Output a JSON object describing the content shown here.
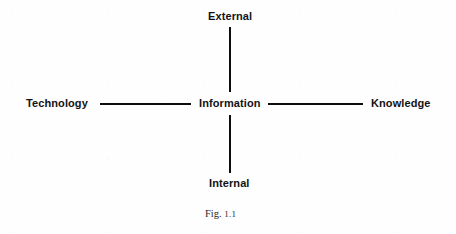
{
  "figure": {
    "caption_prefix": "Fig.",
    "caption_number": "1.1",
    "line_color": "#0d0d0d",
    "text_color": "#131313",
    "background_color": "#fefefe"
  },
  "diagram": {
    "type": "cross-concept-diagram",
    "center": {
      "label": "Information"
    },
    "nodes": [
      {
        "id": "top",
        "label": "External",
        "position": "top"
      },
      {
        "id": "left",
        "label": "Technology",
        "position": "left"
      },
      {
        "id": "right",
        "label": "Knowledge",
        "position": "right"
      },
      {
        "id": "bottom",
        "label": "Internal",
        "position": "bottom"
      }
    ],
    "connectors": [
      {
        "id": "center-to-top",
        "orientation": "vertical"
      },
      {
        "id": "center-to-bottom",
        "orientation": "vertical"
      },
      {
        "id": "center-to-left",
        "orientation": "horizontal"
      },
      {
        "id": "center-to-right",
        "orientation": "horizontal"
      }
    ]
  }
}
